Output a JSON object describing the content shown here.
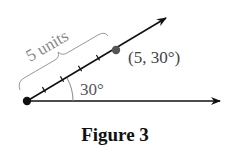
{
  "figure": {
    "caption": "Figure 3",
    "point_label": "(5, 30°)",
    "angle_label": "30°",
    "length_label": "5 units",
    "colors": {
      "line": "#111111",
      "point": "#555555",
      "bracket": "#999999",
      "text_gray": "#777777",
      "text_dark": "#222222"
    }
  }
}
